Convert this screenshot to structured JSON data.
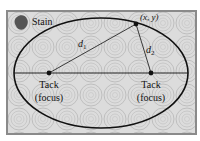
{
  "diagram": {
    "labels": {
      "stain": "Stain",
      "point": "(x, y)",
      "d1_base": "d",
      "d1_sub": "1",
      "d2_base": "d",
      "d2_sub": "2",
      "left_focus_line1": "Tack",
      "left_focus_line2": "(focus)",
      "right_focus_line1": "Tack",
      "right_focus_line2": "(focus)"
    },
    "colors": {
      "background": "#ffffff",
      "board_fill": "#dcdcdc",
      "board_border": "#8a8a8a",
      "pattern_stroke": "#a9a9a9",
      "ellipse_stroke": "#111111",
      "stain": "#555555"
    },
    "geometry": {
      "board": {
        "x": 7,
        "y": 11,
        "w": 189,
        "h": 123
      },
      "ellipse": {
        "cx": 101,
        "cy": 73,
        "rx": 87,
        "ry": 55
      },
      "left_focus": {
        "x": 49,
        "y": 73
      },
      "right_focus": {
        "x": 151,
        "y": 73
      },
      "point": {
        "x": 136,
        "y": 24
      }
    }
  }
}
